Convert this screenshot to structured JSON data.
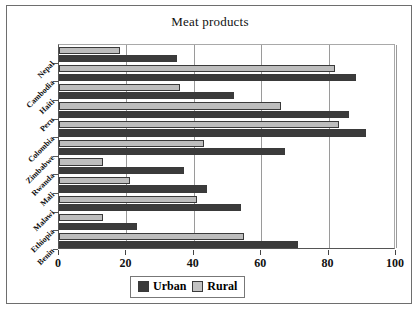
{
  "chart_data": {
    "type": "bar",
    "orientation": "horizontal",
    "title": "Meat products",
    "xlabel": "",
    "ylabel": "",
    "xlim": [
      0,
      100
    ],
    "xticks": [
      0,
      20,
      40,
      60,
      80,
      100
    ],
    "grid": true,
    "legend_position": "bottom-center",
    "categories": [
      "Nepal",
      "Cambodia",
      "Haiti",
      "Peru",
      "Colombia",
      "Zimbabwe",
      "Rwanda",
      "Mali",
      "Malawi",
      "Ethiopia",
      "Benin"
    ],
    "series": [
      {
        "name": "Urban",
        "color": "#3b3b3b",
        "values": [
          35,
          88,
          52,
          86,
          91,
          67,
          37,
          44,
          54,
          23,
          71
        ]
      },
      {
        "name": "Rural",
        "color": "#bdbdbd",
        "values": [
          18,
          82,
          36,
          66,
          83,
          43,
          13,
          21,
          41,
          13,
          55
        ]
      }
    ]
  },
  "legend": {
    "urban_label": "Urban",
    "rural_label": "Rural"
  }
}
